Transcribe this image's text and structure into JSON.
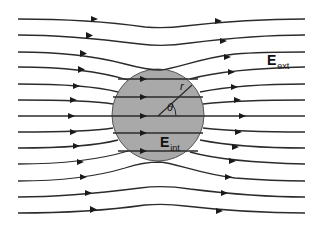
{
  "diagram": {
    "colors": {
      "background": "#ffffff",
      "sphere_fill": "#a9a9a9",
      "sphere_stroke": "#555555",
      "line": "#2b2b2b"
    },
    "labels": {
      "external_field": {
        "main": "E",
        "sub": "ext"
      },
      "internal_field": {
        "main": "E",
        "sub": "int"
      },
      "radius": "r",
      "angle": "θ"
    },
    "sphere": {
      "cx": 158,
      "cy": 115,
      "r": 46
    },
    "field_line_count": 13,
    "interior_line_count": 5
  }
}
